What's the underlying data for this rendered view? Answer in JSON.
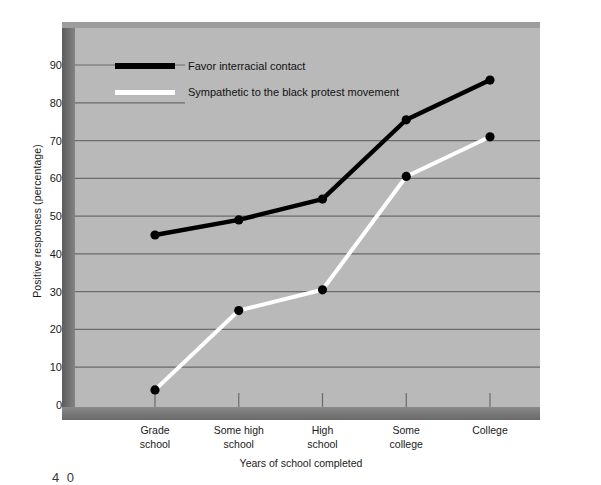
{
  "chart_data": {
    "type": "line",
    "title": "",
    "subtitle": "",
    "xlabel": "Years of school completed",
    "ylabel": "Positive responses (percentage)",
    "categories": [
      "Grade\nschool",
      "Some high\nschool",
      "High\nschool",
      "Some\ncollege",
      "College"
    ],
    "category_lines": [
      [
        "Grade",
        "school"
      ],
      [
        "Some high",
        "school"
      ],
      [
        "High",
        "school"
      ],
      [
        "Some",
        "college"
      ],
      [
        "College"
      ]
    ],
    "ylim": [
      0,
      95
    ],
    "yticks": [
      0,
      10,
      20,
      30,
      40,
      50,
      60,
      70,
      80,
      90
    ],
    "ytick_labels": [
      "0",
      "10",
      "20",
      "30",
      "40",
      "50",
      "60",
      "70",
      "80",
      "90"
    ],
    "grid": true,
    "grid_axis": "y",
    "legend_position": "upper-left-inside",
    "series": [
      {
        "name": "Favor interracial contact",
        "color": "#000000",
        "marker": "circle",
        "values": [
          45,
          49,
          54.5,
          75.5,
          86
        ]
      },
      {
        "name": "Sympathetic to the black protest movement",
        "color": "#ffffff",
        "marker": "circle",
        "marker_color": "#000000",
        "values": [
          4,
          25,
          30.5,
          60.5,
          71
        ]
      }
    ]
  },
  "legend": {
    "items": [
      {
        "label": "Favor interracial contact",
        "swatch": "black"
      },
      {
        "label": "Sympathetic to the black protest movement",
        "swatch": "white"
      }
    ]
  },
  "caption": {
    "text": "4 0"
  },
  "colors": {
    "plot_background": "#b9b9b9",
    "frame_shadow": "#6e6e6e",
    "gridline": "#6b6b6b",
    "series_black": "#000000",
    "series_white": "#ffffff",
    "page_background": "#ffffff"
  }
}
